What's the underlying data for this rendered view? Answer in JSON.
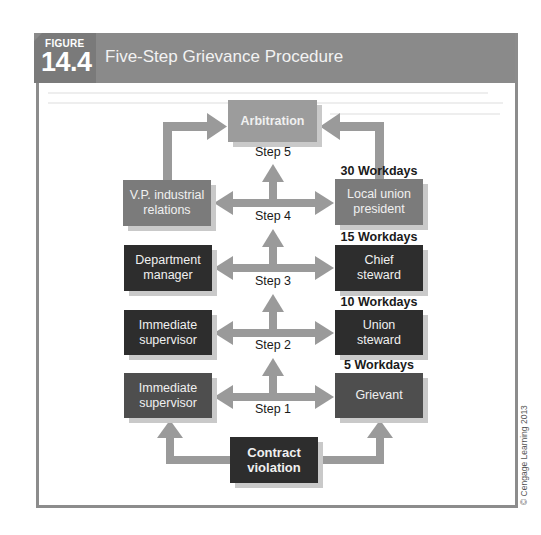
{
  "figure": {
    "label": "FIGURE",
    "number": "14.4",
    "title": "Five-Step Grievance Procedure"
  },
  "diagram": {
    "top": {
      "label": "Arbitration"
    },
    "left_boxes": [
      {
        "label": "V.P. industrial relations",
        "line1": "V.P. industrial",
        "line2": "relations"
      },
      {
        "label": "Department manager",
        "line1": "Department",
        "line2": "manager"
      },
      {
        "label": "Immediate supervisor",
        "line1": "Immediate",
        "line2": "supervisor"
      },
      {
        "label": "Immediate supervisor",
        "line1": "Immediate",
        "line2": "supervisor"
      }
    ],
    "right_boxes": [
      {
        "label": "Local union president",
        "line1": "Local union",
        "line2": "president"
      },
      {
        "label": "Chief steward",
        "line1": "Chief",
        "line2": "steward"
      },
      {
        "label": "Union steward",
        "line1": "Union",
        "line2": "steward"
      },
      {
        "label": "Grievant",
        "line1": "Grievant",
        "line2": ""
      }
    ],
    "bottom": {
      "line1": "Contract",
      "line2": "violation"
    },
    "steps": [
      "Step 5",
      "Step 4",
      "Step 3",
      "Step 2",
      "Step 1"
    ],
    "time_limits": [
      "30 Workdays",
      "15 Workdays",
      "10 Workdays",
      "5 Workdays"
    ],
    "colors": {
      "light_gray": "#9c9c9c",
      "mid_gray": "#7b7b7b",
      "dark": "#2d2d2d",
      "arrow": "#9a9a9a"
    }
  },
  "copyright": "© Cengage Learning 2013"
}
